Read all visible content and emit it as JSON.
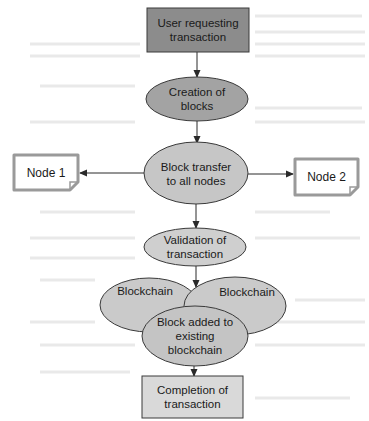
{
  "diagram": {
    "type": "flowchart",
    "colors": {
      "start_box": "#8c8c8c",
      "creation_ellipse": "#a3a3a3",
      "transfer_ellipse": "#c6c6c6",
      "validation_ellipse": "#cfcfcf",
      "blockchain_ellipse": "#cacaca",
      "block_added_ellipse": "#c4c4c4",
      "end_box": "#d9d9d9",
      "node_border": "#9a9a9a",
      "stroke": "#3a3a3a"
    },
    "nodes": {
      "user_request": {
        "label": "User requesting\ntransaction",
        "shape": "rectangle"
      },
      "creation": {
        "label": "Creation of\nblocks",
        "shape": "ellipse"
      },
      "transfer": {
        "label": "Block transfer\nto all nodes",
        "shape": "ellipse"
      },
      "node1": {
        "label": "Node 1",
        "shape": "document"
      },
      "node2": {
        "label": "Node 2",
        "shape": "document"
      },
      "validation": {
        "label": "Validation of\ntransaction",
        "shape": "ellipse"
      },
      "blockchain_left": {
        "label": "Blockchain",
        "shape": "ellipse"
      },
      "blockchain_right": {
        "label": "Blockchain",
        "shape": "ellipse"
      },
      "block_added": {
        "label": "Block added to\nexisting\nblockchain",
        "shape": "ellipse"
      },
      "completion": {
        "label": "Completion of\ntransaction",
        "shape": "rectangle"
      }
    },
    "edges": [
      {
        "from": "user_request",
        "to": "creation"
      },
      {
        "from": "creation",
        "to": "transfer"
      },
      {
        "from": "transfer",
        "to": "node1"
      },
      {
        "from": "transfer",
        "to": "node2"
      },
      {
        "from": "transfer",
        "to": "validation"
      },
      {
        "from": "validation",
        "to": "blockchain_cluster"
      },
      {
        "from": "block_added",
        "to": "completion"
      }
    ]
  }
}
